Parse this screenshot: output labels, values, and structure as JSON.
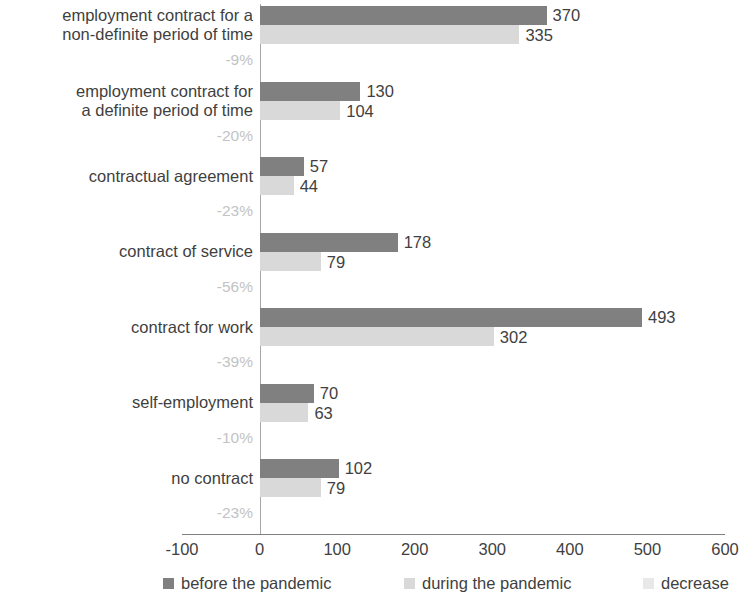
{
  "chart_data": {
    "type": "bar",
    "orientation": "horizontal",
    "title": "",
    "subtitle": "",
    "xlabel": "",
    "ylabel": "",
    "xlim": [
      -100,
      600
    ],
    "xticks": [
      "-100",
      "0",
      "100",
      "200",
      "300",
      "400",
      "500",
      "600"
    ],
    "xtick_values": [
      -100,
      0,
      100,
      200,
      300,
      400,
      500,
      600
    ],
    "grid": false,
    "legend_position": "bottom",
    "categories": [
      "employment contract for a\nnon-definite period of time",
      "employment contract for\na definite period of time",
      "contractual agreement",
      "contract of service",
      "contract for work",
      "self-employment",
      "no contract"
    ],
    "series": [
      {
        "name": "before the pandemic",
        "color": "#808080",
        "values": [
          370,
          130,
          57,
          178,
          493,
          70,
          102
        ],
        "labels": [
          "370",
          "130",
          "57",
          "178",
          "493",
          "70",
          "102"
        ]
      },
      {
        "name": "during the pandemic",
        "color": "#d9d9d9",
        "values": [
          335,
          104,
          44,
          79,
          302,
          63,
          79
        ],
        "labels": [
          "335",
          "104",
          "44",
          "79",
          "302",
          "63",
          "79"
        ]
      },
      {
        "name": "decrease",
        "color": "#e8e8e8",
        "values": [
          -9,
          -20,
          -23,
          -56,
          -39,
          -10,
          -23
        ],
        "labels": [
          "-9%",
          "-20%",
          "-23%",
          "-56%",
          "-39%",
          "-10%",
          "-23%"
        ]
      }
    ],
    "legend": [
      {
        "label": "before the pandemic",
        "color": "#808080"
      },
      {
        "label": "during the pandemic",
        "color": "#d9d9d9"
      },
      {
        "label": "decrease",
        "color": "#e8e8e8"
      }
    ]
  }
}
